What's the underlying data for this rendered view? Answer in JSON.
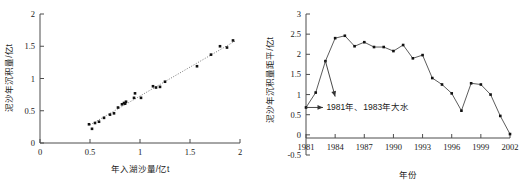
{
  "figure": {
    "background_color": "#ffffff",
    "marker_color": "#111111",
    "line_color": "#4a4a4a",
    "axis_color": "#4d4d4d",
    "panels": [
      "left-scatter",
      "right-timeseries"
    ]
  },
  "chart_data": [
    {
      "type": "scatter",
      "id": "left-scatter",
      "title": "",
      "xlabel": "年入湖沙量/亿t",
      "ylabel": "泥沙年沉积量/亿t",
      "xlim": [
        0,
        2
      ],
      "ylim": [
        0,
        2
      ],
      "xticks": [
        0,
        0.5,
        1,
        1.5,
        2
      ],
      "xticklabels": [
        "0",
        "0.5",
        "1",
        "1.5",
        "2"
      ],
      "yticks": [
        0,
        0.5,
        1,
        1.5,
        2
      ],
      "yticklabels": [
        "0",
        "0.5",
        "1",
        "1.5",
        "2"
      ],
      "grid": false,
      "legend": null,
      "trendline": {
        "style": "dotted",
        "x": [
          0.5,
          1.95
        ],
        "y": [
          0.28,
          1.58
        ]
      },
      "points": [
        {
          "x": 0.49,
          "y": 0.29
        },
        {
          "x": 0.52,
          "y": 0.22
        },
        {
          "x": 0.55,
          "y": 0.31
        },
        {
          "x": 0.59,
          "y": 0.33
        },
        {
          "x": 0.64,
          "y": 0.39
        },
        {
          "x": 0.7,
          "y": 0.44
        },
        {
          "x": 0.74,
          "y": 0.46
        },
        {
          "x": 0.78,
          "y": 0.55
        },
        {
          "x": 0.82,
          "y": 0.6
        },
        {
          "x": 0.84,
          "y": 0.62
        },
        {
          "x": 0.85,
          "y": 0.61
        },
        {
          "x": 0.86,
          "y": 0.64
        },
        {
          "x": 0.94,
          "y": 0.7
        },
        {
          "x": 0.95,
          "y": 0.77
        },
        {
          "x": 1.01,
          "y": 0.7
        },
        {
          "x": 1.13,
          "y": 0.88
        },
        {
          "x": 1.16,
          "y": 0.86
        },
        {
          "x": 1.2,
          "y": 0.87
        },
        {
          "x": 1.25,
          "y": 0.95
        },
        {
          "x": 1.57,
          "y": 1.19
        },
        {
          "x": 1.71,
          "y": 1.37
        },
        {
          "x": 1.8,
          "y": 1.5
        },
        {
          "x": 1.87,
          "y": 1.48
        },
        {
          "x": 1.93,
          "y": 1.59
        }
      ]
    },
    {
      "type": "line",
      "id": "right-timeseries",
      "title": "",
      "xlabel": "年份",
      "ylabel": "泥沙年沉积量距平/亿t",
      "xlim": [
        1981,
        2002
      ],
      "ylim": [
        -0.5,
        3
      ],
      "xticks": [
        1981,
        1984,
        1987,
        1990,
        1993,
        1996,
        1999,
        2002
      ],
      "xticklabels": [
        "1981",
        "1984",
        "1987",
        "1990",
        "1993",
        "1996",
        "1999",
        "2002"
      ],
      "yticks": [
        -0.5,
        0,
        0.5,
        1,
        1.5,
        2,
        2.5,
        3
      ],
      "yticklabels": [
        "-0.5",
        "0",
        "0.5",
        "1",
        "1.5",
        "2",
        "2.5",
        "3"
      ],
      "grid": false,
      "legend": null,
      "marker": "filled-square",
      "x": [
        1981,
        1982,
        1983,
        1984,
        1985,
        1986,
        1987,
        1988,
        1989,
        1990,
        1991,
        1992,
        1993,
        1994,
        1995,
        1996,
        1997,
        1998,
        1999,
        2000,
        2001,
        2002
      ],
      "values": [
        0.68,
        1.05,
        1.83,
        2.4,
        2.46,
        2.2,
        2.3,
        2.18,
        2.18,
        2.08,
        2.23,
        1.9,
        1.98,
        1.41,
        1.25,
        1.03,
        0.6,
        1.28,
        1.25,
        1.0,
        0.47,
        0.02
      ],
      "annotations": [
        {
          "text": "1981年、1983年大水",
          "x": 1983.1,
          "y": 0.7,
          "arrows": [
            {
              "from": {
                "x": 1981.0,
                "y": 0.68
              },
              "to": {
                "x": 1982.75,
                "y": 0.68
              }
            },
            {
              "from": {
                "x": 1983.0,
                "y": 1.83
              },
              "to": {
                "x": 1984.0,
                "y": 0.95
              }
            }
          ]
        }
      ]
    }
  ]
}
